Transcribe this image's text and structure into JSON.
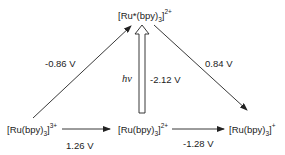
{
  "diagram": {
    "species": {
      "excited": {
        "base": "[Ru*(bpy)",
        "sub": "3",
        "close": "]",
        "charge": "2+"
      },
      "oxidized": {
        "base": "[Ru(bpy)",
        "sub": "3",
        "close": "]",
        "charge": "3+"
      },
      "ground": {
        "base": "[Ru(bpy)",
        "sub": "3",
        "close": "]",
        "charge": "2+"
      },
      "reduced": {
        "base": "[Ru(bpy)",
        "sub": "3",
        "close": "]",
        "charge": "+"
      }
    },
    "potentials": {
      "excited_to_oxidized": "-0.86 V",
      "excited_to_reduced": "0.84 V",
      "excitation": "-2.12 V",
      "oxidized_to_ground": "1.26 V",
      "ground_to_reduced": "-1.28 V"
    },
    "light_label": "hν",
    "colors": {
      "line": "#222222",
      "text": "#222222",
      "background": "#ffffff"
    }
  }
}
